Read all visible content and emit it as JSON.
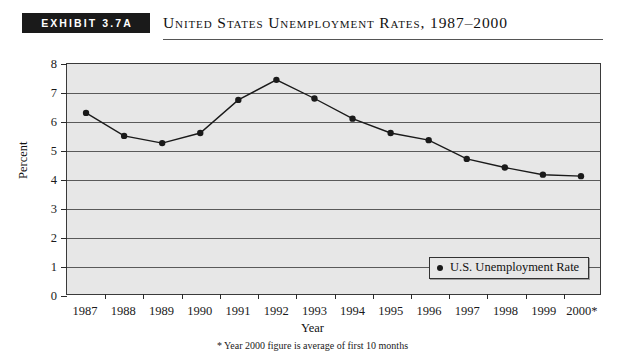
{
  "header": {
    "exhibit_badge": "EXHIBIT 3.7A",
    "title": "United States Unemployment Rates, 1987–2000"
  },
  "footnote": "* Year 2000 figure is average of first 10 months",
  "legend": {
    "label": "U.S. Unemployment Rate",
    "marker_icon": "filled-circle-icon"
  },
  "colors": {
    "plot_background": "#e7e7e7",
    "gridline": "#5a5a5a",
    "series_line": "#1a1a1a",
    "marker": "#1a1a1a",
    "badge_background": "#1a1a1a",
    "badge_text": "#ffffff"
  },
  "chart_data": {
    "type": "line",
    "title": "United States Unemployment Rates, 1987–2000",
    "xlabel": "Year",
    "ylabel": "Percent",
    "categories": [
      "1987",
      "1988",
      "1989",
      "1990",
      "1991",
      "1992",
      "1993",
      "1994",
      "1995",
      "1996",
      "1997",
      "1998",
      "1999",
      "2000*"
    ],
    "values": [
      6.3,
      5.5,
      5.25,
      5.6,
      6.75,
      7.45,
      6.8,
      6.1,
      5.6,
      5.35,
      4.7,
      4.4,
      4.15,
      4.1
    ],
    "series": [
      {
        "name": "U.S. Unemployment Rate",
        "values": [
          6.3,
          5.5,
          5.25,
          5.6,
          6.75,
          7.45,
          6.8,
          6.1,
          5.6,
          5.35,
          4.7,
          4.4,
          4.15,
          4.1
        ]
      }
    ],
    "ylim": [
      0,
      8
    ],
    "yticks": [
      0,
      1,
      2,
      3,
      4,
      5,
      6,
      7,
      8
    ],
    "ytick_labels": [
      "0",
      "1",
      "2",
      "3",
      "4",
      "5",
      "6",
      "7",
      "8"
    ],
    "grid": true,
    "legend_position": "inside-bottom-right",
    "annotations": [
      "* Year 2000 figure is average of first 10 months"
    ]
  }
}
